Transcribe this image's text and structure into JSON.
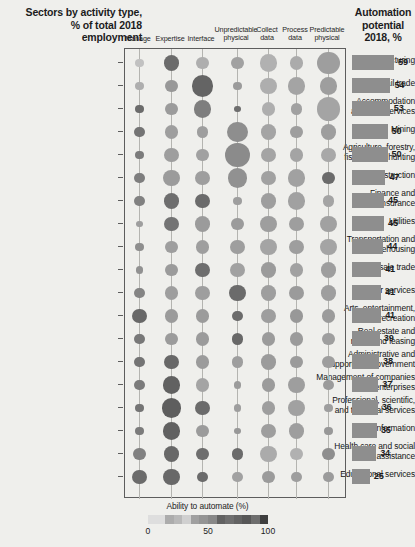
{
  "header": {
    "title_lines": [
      "Sectors by activity type,",
      "% of total 2018",
      "employment"
    ],
    "automation_lines": [
      "Automation",
      "potential",
      "2018, %"
    ]
  },
  "legend": {
    "title": "Ability to automate (%)",
    "ticks": [
      "0",
      "50",
      "100"
    ],
    "scale_min": 0,
    "scale_mid": 50,
    "scale_max": 100
  },
  "chart_data": {
    "type": "bubble",
    "title": "Sectors by activity type, % of total 2018 employment",
    "xlabel": "",
    "ylabel": "",
    "grid": false,
    "legend_position": "bottom-center",
    "size_encoding": "% of total 2018 employment (bubble area)",
    "color_encoding": "Ability to automate (%) — light = low, dark = high",
    "categories": [
      "Manage",
      "Expertise",
      "Interface",
      "Unpredictable physical",
      "Collect data",
      "Process data",
      "Predictable physical"
    ],
    "sectors": [
      "Manufacturing",
      "Retail trade",
      "Accommodation and food services",
      "Mining",
      "Agriculture, forestry, fishing, and hunting",
      "Construction",
      "Finance and insurance",
      "Utilities",
      "Transportation and warehousing",
      "Wholesale trade",
      "Other services",
      "Arts, entertainment, and recreation",
      "Real estate and rental and leasing",
      "Administrative and support and government",
      "Management of companies and enterprises",
      "Professional, scientific, and technical services",
      "Information",
      "Health care and social assistance",
      "Educational services"
    ],
    "sector_label_lines": [
      [
        "Manufacturing"
      ],
      [
        "Retail trade"
      ],
      [
        "Accommodation",
        "and food services"
      ],
      [
        "Mining"
      ],
      [
        "Agriculture, forestry,",
        "fishing, and hunting"
      ],
      [
        "Construction"
      ],
      [
        "Finance and",
        "insurance"
      ],
      [
        "Utilities"
      ],
      [
        "Transportation and",
        "warehousing"
      ],
      [
        "Wholesale trade"
      ],
      [
        "Other services"
      ],
      [
        "Arts, entertainment,",
        "and recreation"
      ],
      [
        "Real estate and",
        "rental and leasing"
      ],
      [
        "Administrative and",
        "support and government"
      ],
      [
        "Management of companies",
        "and enterprises"
      ],
      [
        "Professional, scientific,",
        "and technical services"
      ],
      [
        "Information"
      ],
      [
        "Health care and social",
        "assistance"
      ],
      [
        "Educational services"
      ]
    ],
    "automation_potential": [
      59,
      54,
      53,
      50,
      50,
      47,
      45,
      45,
      44,
      41,
      41,
      41,
      39,
      38,
      37,
      36,
      35,
      34,
      25
    ],
    "bubbles": {
      "note": "rows align with 'sectors'; columns align with 'categories'. size = share of employment (relative), automate = ability to automate (%)",
      "rows": [
        {
          "sector": "Manufacturing",
          "size": [
            8,
            14,
            11,
            11,
            16,
            12,
            20
          ],
          "automate": [
            18,
            72,
            30,
            38,
            28,
            32,
            40
          ]
        },
        {
          "sector": "Retail trade",
          "size": [
            8,
            11,
            19,
            8,
            15,
            16,
            16
          ],
          "automate": [
            30,
            44,
            76,
            42,
            30,
            36,
            40
          ]
        },
        {
          "sector": "Accommodation and food services",
          "size": [
            8,
            11,
            16,
            6,
            12,
            10,
            21
          ],
          "automate": [
            72,
            42,
            60,
            70,
            30,
            38,
            36
          ]
        },
        {
          "sector": "Mining",
          "size": [
            9,
            12,
            10,
            18,
            14,
            11,
            14
          ],
          "automate": [
            66,
            40,
            40,
            50,
            36,
            40,
            40
          ]
        },
        {
          "sector": "Agriculture, forestry, fishing, and hunting",
          "size": [
            8,
            13,
            11,
            22,
            13,
            12,
            13
          ],
          "automate": [
            62,
            40,
            38,
            52,
            36,
            36,
            34
          ]
        },
        {
          "sector": "Construction",
          "size": [
            9,
            15,
            13,
            17,
            13,
            16,
            11
          ],
          "automate": [
            60,
            42,
            40,
            48,
            38,
            38,
            72
          ]
        },
        {
          "sector": "Finance and insurance",
          "size": [
            9,
            14,
            13,
            8,
            14,
            16,
            10
          ],
          "automate": [
            58,
            70,
            72,
            40,
            40,
            38,
            36
          ]
        },
        {
          "sector": "Transportation and warehousing",
          "size": [
            6,
            13,
            14,
            11,
            15,
            13,
            15
          ],
          "automate": [
            40,
            66,
            42,
            42,
            40,
            40,
            38
          ]
        },
        {
          "sector": "Utilities",
          "size": [
            8,
            11,
            12,
            13,
            15,
            13,
            15
          ],
          "automate": [
            50,
            40,
            40,
            40,
            36,
            40,
            36
          ]
        },
        {
          "sector": "Wholesale trade",
          "size": [
            7,
            11,
            13,
            13,
            14,
            12,
            14
          ],
          "automate": [
            48,
            42,
            70,
            38,
            42,
            38,
            40
          ]
        },
        {
          "sector": "Other services",
          "size": [
            9,
            12,
            13,
            15,
            14,
            13,
            14
          ],
          "automate": [
            56,
            40,
            40,
            72,
            40,
            42,
            40
          ]
        },
        {
          "sector": "Arts, entertainment, and recreation",
          "size": [
            13,
            12,
            12,
            9,
            13,
            12,
            12
          ],
          "automate": [
            74,
            42,
            42,
            72,
            40,
            44,
            42
          ]
        },
        {
          "sector": "Real estate and rental and leasing",
          "size": [
            9,
            11,
            12,
            10,
            12,
            12,
            11
          ],
          "automate": [
            64,
            42,
            42,
            74,
            42,
            42,
            40
          ]
        },
        {
          "sector": "Administrative and support and government",
          "size": [
            9,
            13,
            12,
            10,
            14,
            11,
            11
          ],
          "automate": [
            66,
            74,
            42,
            40,
            42,
            42,
            40
          ]
        },
        {
          "sector": "Management of companies and enterprises",
          "size": [
            9,
            16,
            12,
            7,
            12,
            15,
            9
          ],
          "automate": [
            62,
            78,
            36,
            42,
            42,
            40,
            42
          ]
        },
        {
          "sector": "Professional, scientific, and technical services",
          "size": [
            8,
            17,
            13,
            7,
            12,
            15,
            8
          ],
          "automate": [
            66,
            80,
            72,
            40,
            40,
            38,
            40
          ]
        },
        {
          "sector": "Information",
          "size": [
            8,
            16,
            11,
            6,
            13,
            14,
            8
          ],
          "automate": [
            62,
            78,
            42,
            44,
            40,
            40,
            44
          ]
        },
        {
          "sector": "Health care and social assistance",
          "size": [
            11,
            14,
            11,
            10,
            15,
            11,
            11
          ],
          "automate": [
            58,
            74,
            70,
            72,
            32,
            28,
            50
          ]
        },
        {
          "sector": "Educational services",
          "size": [
            13,
            15,
            9,
            9,
            11,
            9,
            9
          ],
          "automate": [
            72,
            74,
            72,
            38,
            42,
            40,
            42
          ]
        }
      ]
    }
  }
}
